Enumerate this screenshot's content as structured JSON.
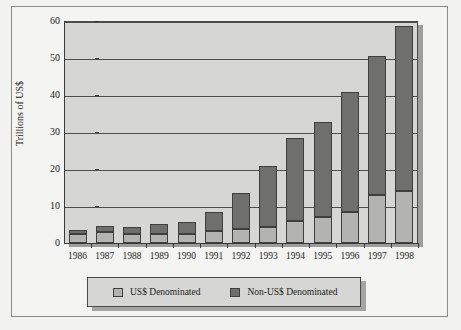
{
  "chart_data": {
    "type": "bar",
    "subtype": "stacked-bar",
    "title": "",
    "xlabel": "",
    "ylabel": "Trillions of US$",
    "ylim": [
      0,
      60
    ],
    "yticks": [
      0,
      10,
      20,
      30,
      40,
      50,
      60
    ],
    "ytick_labels": [
      "0",
      "10",
      "20",
      "30",
      "40",
      "50",
      "60"
    ],
    "grid": true,
    "legend_position": "bottom",
    "categories": [
      "1986",
      "1987",
      "1988",
      "1989",
      "1990",
      "1991",
      "1992",
      "1993",
      "1994",
      "1995",
      "1996",
      "1997",
      "1998"
    ],
    "series": [
      {
        "name": "US$ Denominated",
        "color": "#b3b3b1",
        "values": [
          2.4,
          2.9,
          2.4,
          2.5,
          2.4,
          3.2,
          3.8,
          4.2,
          6.0,
          7.0,
          8.5,
          13.0,
          14.0
        ]
      },
      {
        "name": "Non-US$ Denominated",
        "color": "#6f6f6d",
        "values": [
          1.1,
          1.8,
          1.9,
          2.6,
          3.3,
          5.1,
          9.8,
          16.5,
          22.3,
          25.6,
          32.4,
          37.5,
          44.6
        ]
      }
    ],
    "totals": [
      3.5,
      4.7,
      4.3,
      5.1,
      5.7,
      8.3,
      13.6,
      20.7,
      28.3,
      32.6,
      40.9,
      50.5,
      58.6
    ]
  },
  "legend": {
    "items": [
      {
        "label": "US$ Denominated",
        "color": "#b3b3b1"
      },
      {
        "label": "Non-US$ Denominated",
        "color": "#6f6f6d"
      }
    ]
  },
  "axis": {
    "y_title": "Trillions of US$"
  }
}
